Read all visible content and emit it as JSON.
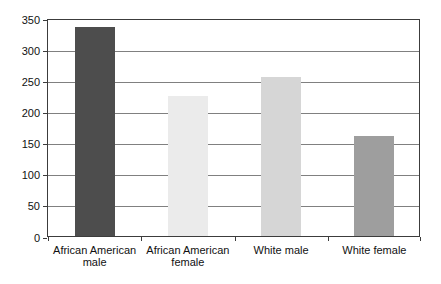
{
  "chart_data": {
    "type": "bar",
    "title": "",
    "xlabel": "",
    "ylabel": "",
    "categories": [
      "African American male",
      "African American female",
      "White male",
      "White female"
    ],
    "values": [
      335,
      225,
      255,
      160
    ],
    "ylim": [
      0,
      350
    ],
    "yticks": [
      0,
      50,
      100,
      150,
      200,
      250,
      300,
      350
    ],
    "grid": "horizontal",
    "legend": "none",
    "bar_colors": [
      "#4d4d4d",
      "#ebebeb",
      "#d6d6d6",
      "#9e9e9e"
    ],
    "plot_border_color": "#3c3c3c",
    "gridline_color": "#808080",
    "text_color": "#111111",
    "background_color": "#ffffff"
  }
}
